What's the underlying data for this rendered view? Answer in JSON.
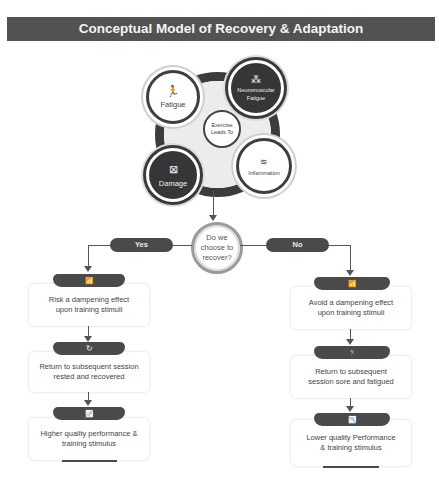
{
  "title": "Conceptual Model of Recovery & Adaptation",
  "cluster": {
    "center": "Exercise Leads To",
    "nodes": [
      {
        "label": "Fatigue",
        "icon": "running-person-icon",
        "glyph": "🏃",
        "style": "light"
      },
      {
        "label": "Neuromuscular Fatigue",
        "icon": "muscle-fiber-icon",
        "glyph": "⁂",
        "style": "dark"
      },
      {
        "label": "Inflammation",
        "icon": "inflammation-icon",
        "glyph": "≋",
        "style": "light"
      },
      {
        "label": "Damage",
        "icon": "damage-icon",
        "glyph": "⊠",
        "style": "dark"
      }
    ]
  },
  "decision": {
    "question": "Do we choose to recover?",
    "yes": "Yes",
    "no": "No"
  },
  "yes_branch": [
    {
      "text": "Risk a dampening effect upon training stimuli",
      "icon": "signal-tower-icon",
      "glyph": "📶"
    },
    {
      "text": "Return to subsequent session rested and recovered",
      "icon": "refresh-icon",
      "glyph": "↻"
    },
    {
      "text": "Higher quality performance & training stimulus",
      "icon": "chart-up-icon",
      "glyph": "📈"
    }
  ],
  "no_branch": [
    {
      "text": "Avoid a dampening effect upon training stimuli",
      "icon": "signal-tower-icon",
      "glyph": "📶"
    },
    {
      "text": "Return to subsequent session sore and fatigued",
      "icon": "running-person-icon",
      "glyph": "🏃"
    },
    {
      "text": "Lower quality Performance & training stimulus",
      "icon": "chart-down-icon",
      "glyph": "📉"
    }
  ],
  "colors": {
    "banner": "#525252",
    "dark": "#3a3a3a",
    "text": "#444444"
  }
}
